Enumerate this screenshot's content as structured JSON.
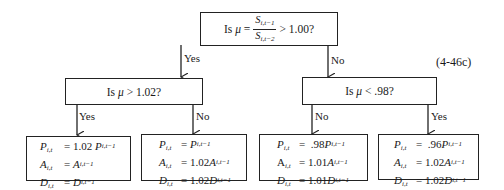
{
  "equation_number": "(4-46c)",
  "root": {
    "prefix": "Is",
    "mu": "μ",
    "equals": "=",
    "numerator": {
      "var": "S",
      "sub": "i,t−1"
    },
    "denominator": {
      "var": "S",
      "sub": "i,t−2"
    },
    "suffix": "> 1.00?"
  },
  "branches": {
    "yes": "Yes",
    "no": "No"
  },
  "left_decision": {
    "prefix": "Is",
    "mu": "μ",
    "suffix": "> 1.02?"
  },
  "right_decision": {
    "prefix": "Is",
    "mu": "μ",
    "suffix": "< .98?"
  },
  "outcomes": [
    {
      "branch_label": "Yes",
      "lines": [
        {
          "var": "P",
          "sub": "i,t",
          "rhs_coef": "= 1.02",
          "rhs_var": "P",
          "rhs_sub": "i,t−1"
        },
        {
          "var": "A",
          "sub": "i,t",
          "rhs_coef": "=",
          "rhs_var": "A",
          "rhs_sub": "i,t−1"
        },
        {
          "var": "D",
          "sub": "i,t",
          "rhs_coef": "=",
          "rhs_var": "D",
          "rhs_sub": "i,t−1"
        }
      ]
    },
    {
      "branch_label": "No",
      "lines": [
        {
          "var": "P",
          "sub": "i,t",
          "rhs_coef": "=",
          "rhs_var": "P",
          "rhs_sub": "i,t−1"
        },
        {
          "var": "A",
          "sub": "i,t",
          "rhs_coef": "= 1.02",
          "rhs_var": "A",
          "rhs_sub": "i,t−1"
        },
        {
          "var": "D",
          "sub": "i,t",
          "rhs_coef": "= 1.02",
          "rhs_var": "D",
          "rhs_sub": "i,t−1"
        }
      ]
    },
    {
      "branch_label": "No",
      "lines": [
        {
          "var": "P",
          "sub": "i,t",
          "rhs_coef": "=  .98",
          "rhs_var": "P",
          "rhs_sub": "i,t−1"
        },
        {
          "var": "A",
          "sub": "i,t",
          "rhs_coef": "= 1.01",
          "rhs_var": "A",
          "rhs_sub": "i,t−1"
        },
        {
          "var": "D",
          "sub": "i,t",
          "rhs_coef": "= 1.01",
          "rhs_var": "D",
          "rhs_sub": "i,t−1"
        }
      ]
    },
    {
      "branch_label": "Yes",
      "lines": [
        {
          "var": "P",
          "sub": "i,t",
          "rhs_coef": "=  .96",
          "rhs_var": "P",
          "rhs_sub": "i,t−1"
        },
        {
          "var": "A",
          "sub": "i,t",
          "rhs_coef": "= 1.02",
          "rhs_var": "A",
          "rhs_sub": "i,t−1"
        },
        {
          "var": "D",
          "sub": "i,t",
          "rhs_coef": "= 1.02",
          "rhs_var": "D",
          "rhs_sub": "i,t−1"
        }
      ]
    }
  ]
}
